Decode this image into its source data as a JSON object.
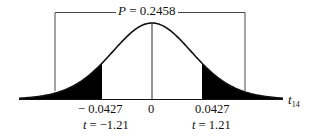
{
  "chart_data": {
    "type": "area",
    "title": "",
    "distribution": "t",
    "degrees_of_freedom": 14,
    "xlabel": "t_14",
    "xlabel_var": "t",
    "xlabel_sub": "14",
    "ylabel": "",
    "p_value_label": {
      "var": "P",
      "text": " = 0.2458",
      "value": 0.2458
    },
    "ticks": [
      {
        "position": -1.21,
        "label": "− 0.0427",
        "t_label": "t = −1.21"
      },
      {
        "position": 0,
        "label": "0",
        "t_label": ""
      },
      {
        "position": 1.21,
        "label": "0.0427",
        "t_label": "t = 1.21"
      }
    ],
    "shaded_regions": [
      {
        "from": "-inf",
        "to": -1.21,
        "tail": "left",
        "statistic_value": -0.0427
      },
      {
        "from": 1.21,
        "to": "inf",
        "tail": "right",
        "statistic_value": 0.0427
      }
    ],
    "t_statistic": 1.21,
    "observed_difference": 0.0427,
    "grid": false,
    "legend": null
  },
  "labels": {
    "p_var": "P",
    "p_text": " = 0.2458",
    "tick_neg": "− 0.0427",
    "tick_zero": "0",
    "tick_pos": "0.0427",
    "t_neg_var": "t",
    "t_neg_text": " = −1.21",
    "t_pos_var": "t",
    "t_pos_text": " = 1.21",
    "axis_var": "t",
    "axis_sub": "14"
  },
  "colors": {
    "ink": "#111111",
    "shade": "#000000",
    "background": "#ffffff"
  }
}
